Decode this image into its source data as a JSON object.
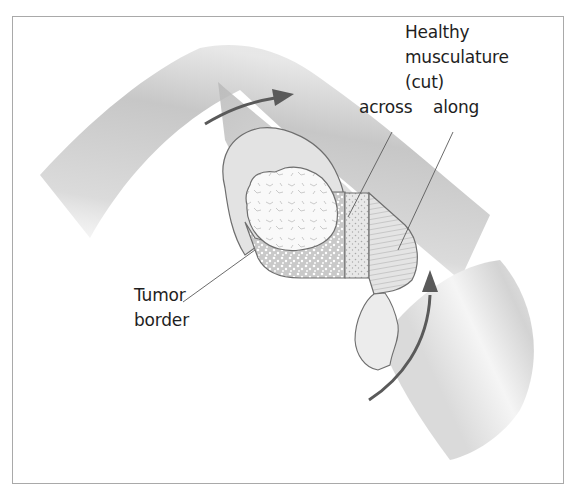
{
  "figure": {
    "labels": {
      "healthy": [
        "Healthy",
        "musculature",
        "(cut)"
      ],
      "across": "across",
      "along": "along",
      "tumor": [
        "Tumor",
        "border"
      ]
    },
    "colors": {
      "frame": "#a9a9a9",
      "arrow": "#5a5a5a",
      "outline": "#6e6e6e",
      "tube_dark": "#bdbdbd",
      "tube_light": "#f2f2f2",
      "text": "#1e1e1e"
    },
    "icons": {
      "upper_arrow": "curved-arrow-right",
      "lower_arrow": "curved-arrow-up"
    }
  }
}
